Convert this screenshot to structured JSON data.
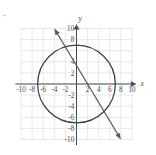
{
  "figure": {
    "title": "",
    "background_color": "#ffffff",
    "grid_color": "#d8d8de",
    "axis_color": "#4a4a52",
    "curve_color": "#3e3e46",
    "line_color": "#55555d",
    "corner_artifact": "+"
  },
  "axes": {
    "x_label": "x",
    "y_label": "y",
    "x_min": -11,
    "x_max": 11,
    "y_min": -11,
    "y_max": 11,
    "x_ticks": [
      -10,
      -8,
      -6,
      -4,
      -2,
      2,
      4,
      6,
      8,
      10
    ],
    "y_ticks": [
      10,
      8,
      6,
      4,
      2,
      -2,
      -4,
      -6,
      -8,
      -10
    ],
    "x_tick_labels": [
      "-10",
      "-8",
      "-6",
      "-4",
      "-2",
      "2",
      "4",
      "6",
      "8",
      "10"
    ],
    "y_tick_labels": [
      "10",
      "8",
      "6",
      "4",
      "2",
      "-2",
      "-4",
      "-6",
      "-8",
      "-10"
    ],
    "y_hidden_tick_labels": [
      "6"
    ],
    "grid": true,
    "grid_step": 2,
    "grid_x_range": [
      -10,
      10
    ],
    "grid_y_range": [
      -10,
      10
    ],
    "arrowheads": [
      "x-positive",
      "y-positive"
    ]
  },
  "chart_data": {
    "type": "scatter",
    "title": "",
    "xlabel": "x",
    "ylabel": "y",
    "xlim": [
      -11,
      11
    ],
    "ylim": [
      -11,
      11
    ],
    "grid": true,
    "legend": "none",
    "series": [
      {
        "name": "circle",
        "kind": "circle",
        "center": [
          0,
          0
        ],
        "radius": 7,
        "equation": "x^2 + y^2 = 49",
        "stroke": "#3e3e46"
      },
      {
        "name": "line",
        "kind": "line",
        "points": [
          [
            -4,
            10
          ],
          [
            8,
            -10
          ]
        ],
        "slope": -1.6667,
        "intercept": 3.3333,
        "double_arrow": true,
        "stroke": "#55555d"
      }
    ]
  }
}
